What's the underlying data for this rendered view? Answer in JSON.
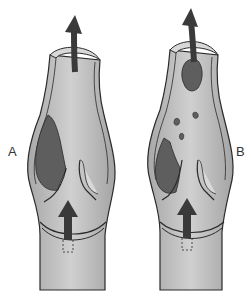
{
  "diagram": {
    "panels": [
      {
        "label": "A",
        "description": "Vein segment with valve; large thrombus in left valve sinus",
        "flow_arrows": [
          "upward-arrow-bottom",
          "curved-upward-arrow-top"
        ],
        "thrombus": "large-sinus-thrombus"
      },
      {
        "label": "B",
        "description": "Vein segment with valve; thrombus fragment embolizing upward with small emboli",
        "flow_arrows": [
          "upward-arrow-bottom",
          "curved-upward-arrow-top"
        ],
        "thrombus": "residual-sinus-thrombus",
        "emboli_count": 4
      }
    ]
  },
  "colors": {
    "vessel_fill": "#b4b4b4",
    "vessel_highlight": "#cfcfcf",
    "wall_fill": "#d8d8d8",
    "outline": "#2a2a2a",
    "thrombus": "#5e5e5e",
    "arrow": "#3a3a3a"
  }
}
